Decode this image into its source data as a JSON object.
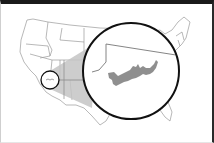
{
  "map": {
    "type": "locator-map",
    "region": "United States (contiguous)",
    "highlight": "Lake Mead area (Nevada / Arizona border)",
    "colors": {
      "state_lines": "#9a9a9a",
      "wedge_fill": "#c4c4c4",
      "lake_fill": "#8f8f8f",
      "circle_stroke": "#111111",
      "frame_top": "#1a1a1a"
    },
    "locator_circle": {
      "cx": 50,
      "cy": 80,
      "r": 9
    },
    "inset_circle": {
      "cx": 131,
      "cy": 71,
      "r": 48
    }
  }
}
